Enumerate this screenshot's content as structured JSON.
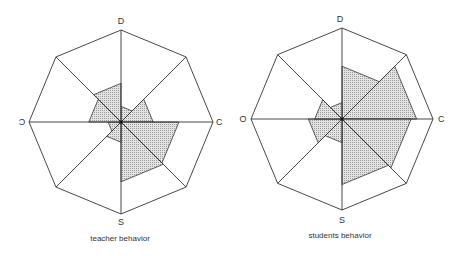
{
  "chart_data": [
    {
      "type": "radar",
      "title": "teacher behavior",
      "axes": [
        "D",
        "NE",
        "C",
        "SE",
        "S",
        "SW",
        "O",
        "NW"
      ],
      "axis_labels": {
        "top": "D",
        "right": "C",
        "bottom": "S",
        "left": "Ɔ"
      },
      "sectors": [
        {
          "from": "D",
          "to": "NE",
          "value": 0.17
        },
        {
          "from": "NE",
          "to": "C",
          "value": 0.35
        },
        {
          "from": "C",
          "to": "SE",
          "value": 0.63
        },
        {
          "from": "SE",
          "to": "S",
          "value": 0.65
        },
        {
          "from": "S",
          "to": "SW",
          "value": 0.22
        },
        {
          "from": "SW",
          "to": "O",
          "value": 0.14
        },
        {
          "from": "O",
          "to": "NW",
          "value": 0.35
        },
        {
          "from": "NW",
          "to": "D",
          "value": 0.42
        }
      ],
      "range": [
        0,
        1
      ],
      "grid": "octagon"
    },
    {
      "type": "radar",
      "title": "students behavior",
      "axes": [
        "D",
        "NE",
        "C",
        "SE",
        "S",
        "SW",
        "O",
        "NW"
      ],
      "axis_labels": {
        "top": "D",
        "right": "C",
        "bottom": "S",
        "left": "O"
      },
      "sectors": [
        {
          "from": "D",
          "to": "NE",
          "value": 0.58
        },
        {
          "from": "NE",
          "to": "C",
          "value": 0.82
        },
        {
          "from": "C",
          "to": "SE",
          "value": 0.76
        },
        {
          "from": "SE",
          "to": "S",
          "value": 0.72
        },
        {
          "from": "S",
          "to": "SW",
          "value": 0.26
        },
        {
          "from": "SW",
          "to": "O",
          "value": 0.37
        },
        {
          "from": "O",
          "to": "NW",
          "value": 0.3
        },
        {
          "from": "NW",
          "to": "D",
          "value": 0.18
        }
      ],
      "range": [
        0,
        1
      ],
      "grid": "octagon"
    }
  ],
  "charts": [
    {
      "cx": 121,
      "cy": 122,
      "r": 92,
      "caption_y": 241
    },
    {
      "cx": 342,
      "cy": 119,
      "r": 91,
      "caption_y": 238
    }
  ],
  "colors": {
    "line": "#333333",
    "fill": "#d4d4d4",
    "hatch": "#9a9a9a"
  }
}
